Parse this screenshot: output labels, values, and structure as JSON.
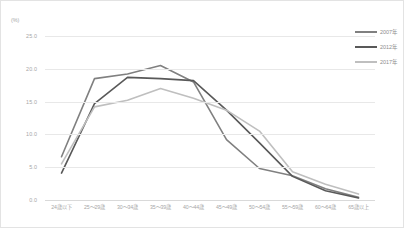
{
  "chart_data": {
    "type": "line",
    "title": "",
    "xlabel": "",
    "ylabel": "(%)",
    "ylim": [
      0,
      25
    ],
    "grid": true,
    "legend_position": "top-right",
    "yticks": [
      "0.0",
      "5.0",
      "10.0",
      "15.0",
      "20.0",
      "25.0"
    ],
    "ytick_values": [
      0,
      5,
      10,
      15,
      20,
      25
    ],
    "categories": [
      "24歳以下",
      "25〜29歳",
      "30〜34歳",
      "35〜39歳",
      "40〜44歳",
      "45〜49歳",
      "50〜54歳",
      "55〜59歳",
      "60〜64歳",
      "65歳以上"
    ],
    "series": [
      {
        "name": "2007年",
        "color": "#808080",
        "values": [
          6.6,
          18.5,
          19.2,
          20.5,
          18.0,
          9.2,
          4.8,
          3.7,
          1.7,
          0.4
        ]
      },
      {
        "name": "2012年",
        "color": "#595959",
        "values": [
          4.1,
          14.7,
          18.7,
          18.5,
          18.2,
          13.7,
          8.7,
          3.6,
          1.4,
          0.3
        ]
      },
      {
        "name": "2017年",
        "color": "#bfbfbf",
        "values": [
          5.5,
          14.2,
          15.2,
          17.0,
          15.5,
          13.7,
          10.5,
          4.3,
          2.4,
          0.9
        ]
      }
    ]
  },
  "axis": {
    "unit_label": "(%)"
  },
  "colors": {
    "grid": "#e8e8e8",
    "axis": "#d9d9d9",
    "tick_text": "#a6a6a6",
    "legend_text": "#8c8c8c",
    "border": "#e3e3e3",
    "background": "#ffffff"
  }
}
